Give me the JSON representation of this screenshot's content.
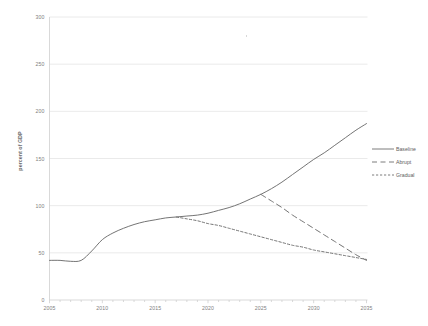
{
  "chart_data": {
    "type": "line",
    "title": "",
    "xlabel": "",
    "ylabel": "percent of GDP",
    "xlim": [
      2005,
      2035
    ],
    "ylim": [
      0,
      300
    ],
    "grid": true,
    "legend_position": "right",
    "x_ticks": [
      "2005",
      "2010",
      "2015",
      "2020",
      "2025",
      "2030",
      "2035"
    ],
    "y_ticks": [
      "0",
      "50",
      "100",
      "150",
      "200",
      "250",
      "300"
    ],
    "series": [
      {
        "name": "Baseline",
        "style": "solid",
        "color": "#6d6d6d",
        "x": [
          2005,
          2006,
          2007,
          2008,
          2009,
          2010,
          2011,
          2012,
          2013,
          2014,
          2015,
          2016,
          2017,
          2018,
          2019,
          2020,
          2021,
          2022,
          2023,
          2024,
          2025,
          2026,
          2027,
          2028,
          2029,
          2030,
          2031,
          2032,
          2033,
          2034,
          2035
        ],
        "values": [
          42,
          42,
          41,
          42,
          52,
          64,
          71,
          76,
          80,
          83,
          85,
          87,
          88,
          89,
          90,
          92,
          95,
          98,
          102,
          107,
          112,
          118,
          125,
          133,
          141,
          149,
          156,
          164,
          172,
          180,
          187
        ]
      },
      {
        "name": "Abrupt",
        "style": "dashed",
        "color": "#6d6d6d",
        "x": [
          2025,
          2026,
          2027,
          2028,
          2029,
          2030,
          2031,
          2032,
          2033,
          2034,
          2035
        ],
        "values": [
          112,
          105,
          98,
          90,
          83,
          76,
          69,
          62,
          55,
          48,
          42
        ]
      },
      {
        "name": "Gradual",
        "style": "dotted",
        "color": "#6d6d6d",
        "x": [
          2017,
          2018,
          2019,
          2020,
          2021,
          2022,
          2023,
          2024,
          2025,
          2026,
          2027,
          2028,
          2029,
          2030,
          2031,
          2032,
          2033,
          2034,
          2035
        ],
        "values": [
          88,
          86,
          84,
          81,
          79,
          76,
          73,
          70,
          67,
          64,
          61,
          58,
          56,
          53,
          51,
          49,
          47,
          45,
          43
        ]
      }
    ]
  },
  "legend": {
    "items": [
      {
        "label": "Baseline",
        "icon": "solid-line-icon"
      },
      {
        "label": "Abrupt",
        "icon": "dashed-line-icon"
      },
      {
        "label": "Gradual",
        "icon": "dotted-line-icon"
      }
    ]
  },
  "colors": {
    "line": "#6d6d6d",
    "grid": "#e4e4e4",
    "axis": "#cfcfcf",
    "tick_text": "#808080",
    "background": "#ffffff"
  }
}
